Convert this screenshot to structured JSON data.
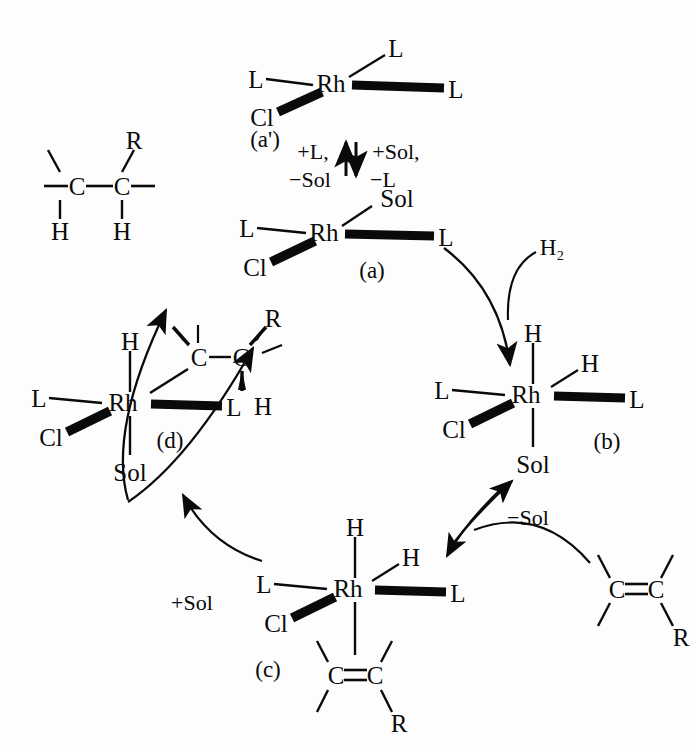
{
  "diagram": {
    "line_color": "#0a0a0a",
    "background": "#fdfdfd"
  },
  "species": {
    "a_prime": {
      "tag": "(a')",
      "center": "Rh",
      "ligand_left": "L",
      "ligand_upper_right": "L",
      "ligand_right": "L",
      "ligand_lower_left": "Cl"
    },
    "a": {
      "tag": "(a)",
      "center": "Rh",
      "ligand_left": "L",
      "ligand_upper_right": "Sol",
      "ligand_right": "L",
      "ligand_lower_left": "Cl"
    },
    "b": {
      "tag": "(b)",
      "center": "Rh",
      "ligand_top": "H",
      "ligand_upper_right": "H",
      "ligand_left": "L",
      "ligand_right": "L",
      "ligand_lower_left": "Cl",
      "ligand_bottom": "Sol"
    },
    "c": {
      "tag": "(c)",
      "center": "Rh",
      "ligand_top": "H",
      "ligand_upper_right": "H",
      "ligand_left": "L",
      "ligand_right": "L",
      "ligand_lower_left": "Cl",
      "alkene_c1": "C",
      "alkene_c2": "C",
      "alkene_r": "R"
    },
    "d": {
      "tag": "(d)",
      "center": "Rh",
      "ligand_top": "H",
      "ligand_left": "L",
      "ligand_right": "L",
      "ligand_lower_left": "Cl",
      "ligand_bottom": "Sol",
      "alkyl_c1": "C",
      "alkyl_c2": "C",
      "alkyl_r": "R",
      "alkyl_h": "H"
    }
  },
  "reagents": {
    "dihydrogen": "H₂",
    "alkene": {
      "c1": "C",
      "c2": "C",
      "r": "R"
    },
    "product_alkane": {
      "c1": "C",
      "c2": "C",
      "r": "R",
      "h1": "H",
      "h2": "H"
    }
  },
  "conditions": {
    "equilibrium_left_top": "+L,",
    "equilibrium_left_bottom": "−Sol",
    "equilibrium_right_top": "+Sol,",
    "equilibrium_right_bottom": "−L",
    "minus_sol": "−Sol",
    "plus_sol": "+Sol"
  }
}
